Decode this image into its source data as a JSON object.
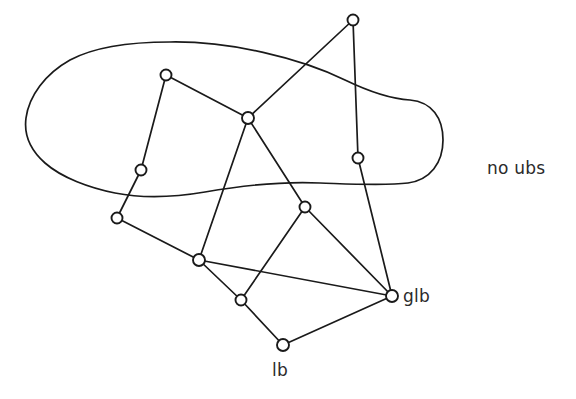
{
  "figure": {
    "background_color": "#ffffff",
    "stroke_color": "#1a1a1a",
    "node_fill_color": "#ffffff",
    "width": 576,
    "height": 399
  },
  "labels": [
    {
      "id": "no-ubs",
      "text": "no ubs",
      "x": 487,
      "y": 158
    },
    {
      "id": "glb",
      "text": "glb",
      "x": 403,
      "y": 286
    },
    {
      "id": "lb",
      "text": "lb",
      "x": 272,
      "y": 360
    }
  ],
  "nodes": [
    {
      "id": "n-top",
      "name": "node-top",
      "x": 353,
      "y": 20,
      "r": 5.5
    },
    {
      "id": "n-upper-left",
      "name": "node-upper-left",
      "x": 166,
      "y": 75,
      "r": 5.5
    },
    {
      "id": "n-center",
      "name": "node-center",
      "x": 248,
      "y": 118,
      "r": 6.0
    },
    {
      "id": "n-right-mid",
      "name": "node-right-middle",
      "x": 358,
      "y": 158,
      "r": 5.5
    },
    {
      "id": "n-left-mid",
      "name": "node-left-middle",
      "x": 141,
      "y": 170,
      "r": 5.5
    },
    {
      "id": "n-mid-right",
      "name": "node-middle-right",
      "x": 305,
      "y": 207,
      "r": 5.5
    },
    {
      "id": "n-left-low",
      "name": "node-left-lower",
      "x": 117,
      "y": 218,
      "r": 5.5
    },
    {
      "id": "n-mid-low",
      "name": "node-middle-lower",
      "x": 199,
      "y": 260,
      "r": 6.0
    },
    {
      "id": "n-glb",
      "name": "node-glb",
      "x": 392,
      "y": 296,
      "r": 6.0
    },
    {
      "id": "n-lower",
      "name": "node-lower",
      "x": 241,
      "y": 300,
      "r": 5.5
    },
    {
      "id": "n-lb",
      "name": "node-lb",
      "x": 283,
      "y": 345,
      "r": 6.0
    }
  ],
  "edges": [
    {
      "id": "e1",
      "from": "n-top",
      "to": "n-center"
    },
    {
      "id": "e2",
      "from": "n-top",
      "to": "n-right-mid"
    },
    {
      "id": "e3",
      "from": "n-upper-left",
      "to": "n-center"
    },
    {
      "id": "e4",
      "from": "n-upper-left",
      "to": "n-left-mid"
    },
    {
      "id": "e5",
      "from": "n-center",
      "to": "n-mid-right"
    },
    {
      "id": "e6",
      "from": "n-center",
      "to": "n-mid-low"
    },
    {
      "id": "e7",
      "from": "n-right-mid",
      "to": "n-glb"
    },
    {
      "id": "e8",
      "from": "n-left-mid",
      "to": "n-left-low"
    },
    {
      "id": "e9",
      "from": "n-mid-right",
      "to": "n-glb"
    },
    {
      "id": "e10",
      "from": "n-mid-right",
      "to": "n-lower"
    },
    {
      "id": "e11",
      "from": "n-left-low",
      "to": "n-mid-low"
    },
    {
      "id": "e12",
      "from": "n-mid-low",
      "to": "n-glb"
    },
    {
      "id": "e13",
      "from": "n-mid-low",
      "to": "n-lower"
    },
    {
      "id": "e14",
      "from": "n-lower",
      "to": "n-lb"
    },
    {
      "id": "e15",
      "from": "n-lb",
      "to": "n-glb"
    }
  ],
  "regions": [
    {
      "id": "upper-blob",
      "name": "upper-set-blob",
      "path": "M 170 42 C 230 41 300 58 345 80 C 372 93 392 99 410 100 C 432 102 443 118 443 140 C 443 163 430 180 408 183 C 385 186 350 184 320 183 C 280 181 240 186 205 192 C 170 198 140 198 115 193 C 90 188 62 178 45 163 C 28 148 24 133 26 118 C 29 96 45 74 70 60 C 98 45 135 42 170 42 Z"
    }
  ]
}
